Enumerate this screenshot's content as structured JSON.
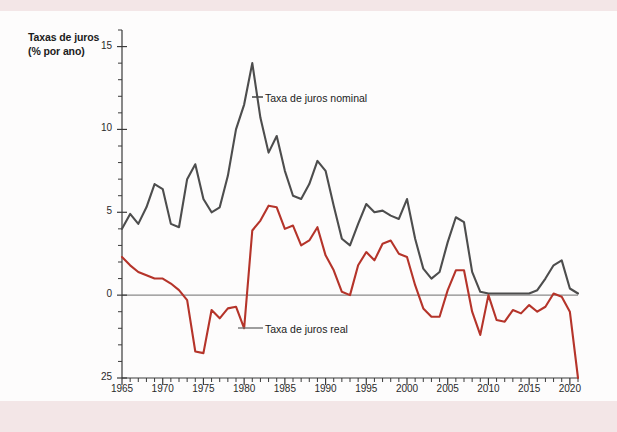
{
  "figure": {
    "axis_title_line1": "Taxas de juros",
    "axis_title_line2": "(% por ano)",
    "background_color": "#f3e6e7",
    "card_color": "#fdfcfc"
  },
  "legend": {
    "nominal_label": "Taxa de juros nominal",
    "real_label": "Taxa de juros real",
    "nominal_color": "#4d4d4d",
    "real_color": "#b5342a"
  },
  "axes": {
    "y_tick_labels": [
      "15",
      "10",
      "5",
      "0",
      "25"
    ],
    "x_tick_labels": [
      "1965",
      "1970",
      "1975",
      "1980",
      "1985",
      "1990",
      "1995",
      "2000",
      "2005",
      "2010",
      "2015",
      "2020"
    ]
  },
  "chart_data": {
    "type": "line",
    "title": "Taxas de juros (% por ano)",
    "xlabel": "",
    "ylabel": "Taxas de juros (% por ano)",
    "xlim": [
      1965,
      2021
    ],
    "ylim": [
      -5,
      16
    ],
    "ytick_values": [
      15,
      10,
      5,
      0,
      -5
    ],
    "ytick_displayed": [
      "15",
      "10",
      "5",
      "0",
      "25"
    ],
    "xtick_values": [
      1965,
      1970,
      1975,
      1980,
      1985,
      1990,
      1995,
      2000,
      2005,
      2010,
      2015,
      2020
    ],
    "grid": false,
    "legend_position": "inline-annotations",
    "zero_line": true,
    "x": [
      1965,
      1966,
      1967,
      1968,
      1969,
      1970,
      1971,
      1972,
      1973,
      1974,
      1975,
      1976,
      1977,
      1978,
      1979,
      1980,
      1981,
      1982,
      1983,
      1984,
      1985,
      1986,
      1987,
      1988,
      1989,
      1990,
      1991,
      1992,
      1993,
      1994,
      1995,
      1996,
      1997,
      1998,
      1999,
      2000,
      2001,
      2002,
      2003,
      2004,
      2005,
      2006,
      2007,
      2008,
      2009,
      2010,
      2011,
      2012,
      2013,
      2014,
      2015,
      2016,
      2017,
      2018,
      2019,
      2020,
      2021
    ],
    "series": [
      {
        "name": "Taxa de juros nominal",
        "color": "#4d4d4d",
        "values": [
          4.0,
          4.9,
          4.3,
          5.3,
          6.7,
          6.4,
          4.3,
          4.1,
          7.0,
          7.9,
          5.8,
          5.0,
          5.3,
          7.2,
          10.0,
          11.5,
          14.0,
          10.7,
          8.6,
          9.6,
          7.5,
          6.0,
          5.8,
          6.7,
          8.1,
          7.5,
          5.4,
          3.4,
          3.0,
          4.3,
          5.5,
          5.0,
          5.1,
          4.8,
          4.6,
          5.8,
          3.4,
          1.6,
          1.0,
          1.4,
          3.2,
          4.7,
          4.4,
          1.4,
          0.2,
          0.1,
          0.1,
          0.1,
          0.1,
          0.1,
          0.1,
          0.3,
          1.0,
          1.8,
          2.1,
          0.4,
          0.1
        ]
      },
      {
        "name": "Taxa de juros real",
        "color": "#b5342a",
        "values": [
          2.3,
          1.8,
          1.4,
          1.2,
          1.0,
          1.0,
          0.7,
          0.3,
          -0.3,
          -3.4,
          -3.5,
          -0.9,
          -1.4,
          -0.8,
          -0.7,
          -2.0,
          3.9,
          4.5,
          5.4,
          5.3,
          4.0,
          4.2,
          3.0,
          3.3,
          4.1,
          2.4,
          1.5,
          0.2,
          0.0,
          1.8,
          2.6,
          2.1,
          3.1,
          3.3,
          2.5,
          2.3,
          0.6,
          -0.8,
          -1.3,
          -1.3,
          0.3,
          1.5,
          1.5,
          -1.0,
          -2.4,
          0.0,
          -1.5,
          -1.6,
          -0.9,
          -1.1,
          -0.6,
          -1.0,
          -0.7,
          0.1,
          -0.1,
          -1.0,
          -5.0
        ]
      }
    ]
  }
}
